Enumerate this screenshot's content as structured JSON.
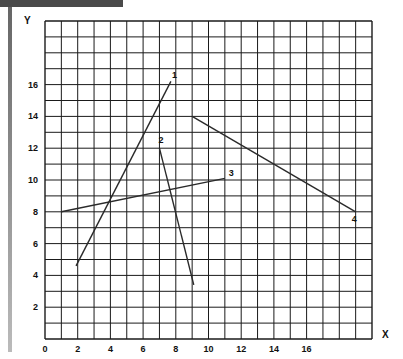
{
  "chart_data": {
    "type": "line",
    "title": "",
    "xlabel": "X",
    "ylabel": "Y",
    "xlim": [
      0,
      20
    ],
    "ylim": [
      0,
      20
    ],
    "grid": true,
    "x_ticks": [
      0,
      2,
      4,
      6,
      8,
      10,
      12,
      14,
      16
    ],
    "y_ticks": [
      2,
      4,
      6,
      8,
      10,
      12,
      14,
      16
    ],
    "series": [
      {
        "name": "1",
        "points": [
          [
            1.9,
            4.6
          ],
          [
            7.7,
            16.2
          ]
        ]
      },
      {
        "name": "2",
        "points": [
          [
            7.0,
            12.0
          ],
          [
            9.1,
            3.4
          ]
        ]
      },
      {
        "name": "3",
        "points": [
          [
            1.0,
            8.0
          ],
          [
            11.0,
            10.1
          ]
        ]
      },
      {
        "name": "4",
        "points": [
          [
            9.0,
            14.0
          ],
          [
            19.0,
            8.0
          ]
        ]
      }
    ],
    "legend": "inline labels at line ends"
  },
  "colors": {
    "grid": "#1a1a1a",
    "line": "#2a2a2a",
    "header_bar": "#4a4a4a"
  }
}
